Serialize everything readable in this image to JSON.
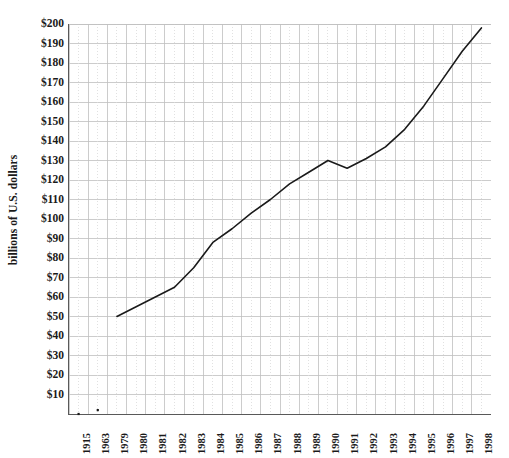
{
  "chart_data": {
    "type": "line",
    "title": "",
    "xlabel": "",
    "ylabel": "billions of U.S. dollars",
    "categories": [
      "1915",
      "1963",
      "1979",
      "1980",
      "1981",
      "1982",
      "1983",
      "1984",
      "1985",
      "1986",
      "1987",
      "1988",
      "1989",
      "1990",
      "1991",
      "1992",
      "1993",
      "1994",
      "1995",
      "1996",
      "1997",
      "1998"
    ],
    "values": [
      0,
      2,
      50,
      55,
      60,
      65,
      75,
      88,
      95,
      103,
      110,
      118,
      124,
      130,
      126,
      131,
      137,
      146,
      158,
      172,
      186,
      198
    ],
    "series": [
      {
        "name": "billions of U.S. dollars",
        "values": [
          0,
          2,
          50,
          55,
          60,
          65,
          75,
          88,
          95,
          103,
          110,
          118,
          124,
          130,
          126,
          131,
          137,
          146,
          158,
          172,
          186,
          198
        ]
      }
    ],
    "ylim": [
      0,
      200
    ],
    "ytick_values": [
      10,
      20,
      30,
      40,
      50,
      60,
      70,
      80,
      90,
      100,
      110,
      120,
      130,
      140,
      150,
      160,
      170,
      180,
      190,
      200
    ],
    "ytick_labels": [
      "$10",
      "$20",
      "$30",
      "$40",
      "$50",
      "$60",
      "$70",
      "$80",
      "$90",
      "$100",
      "$110",
      "$120",
      "$130",
      "$140",
      "$150",
      "$160",
      "$170",
      "$180",
      "$190",
      "$200"
    ],
    "grid": true,
    "grid_minor": true,
    "legend": "none",
    "line_color": "#1a1a1a",
    "grid_color": "#bfbfbf",
    "minor_grid_color": "#d9d9d9",
    "axis_color": "#595959",
    "background_color": "#ffffff",
    "marker_years": [
      "1915",
      "1963"
    ]
  }
}
